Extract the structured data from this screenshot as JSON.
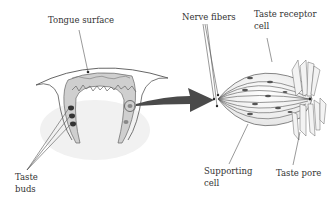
{
  "labels": {
    "tongue_surface": "Tongue surface",
    "taste_buds_line1": "Taste",
    "taste_buds_line2": "buds",
    "nerve_fibers": "Nerve fibers",
    "taste_receptor_line1": "Taste receptor",
    "taste_receptor_line2": "cell",
    "supporting_line1": "Supporting",
    "supporting_line2": "cell",
    "taste_pore": "Taste pore"
  },
  "colors": {
    "outline": "#555555",
    "arrow": "#4a4a4a",
    "shading": "#cfcfcf",
    "text": "#333333"
  }
}
